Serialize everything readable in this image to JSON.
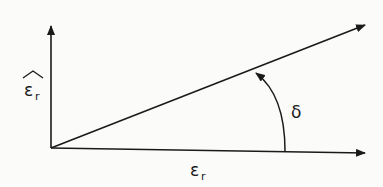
{
  "diagram": {
    "vertical_axis_label": "ε",
    "vertical_axis_subscript": "r",
    "vertical_axis_accent": "hat",
    "horizontal_axis_label": "ε",
    "horizontal_axis_subscript": "r",
    "angle_label": "δ",
    "ink_color": "#1a1a1a",
    "background_color": "#fbfbfa"
  }
}
